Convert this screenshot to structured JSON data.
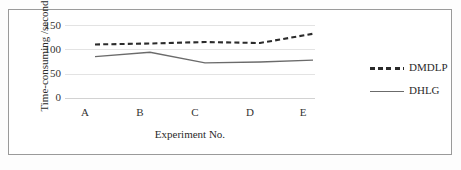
{
  "chart_data": {
    "type": "line",
    "title": "",
    "xlabel": "Experiment No.",
    "ylabel": "Time-consuming /second",
    "categories": [
      "A",
      "B",
      "C",
      "D",
      "E"
    ],
    "yticks": [
      0,
      50,
      100,
      150
    ],
    "ylim": [
      0,
      150
    ],
    "grid": true,
    "legend_position": "right",
    "series": [
      {
        "name": "DMDLP",
        "style": "dashed",
        "color": "#2b2b2b",
        "values": [
          110,
          112,
          115,
          113,
          132
        ]
      },
      {
        "name": "DHLG",
        "style": "solid",
        "color": "#6b6b6b",
        "values": [
          85,
          94,
          72,
          74,
          78
        ]
      }
    ]
  },
  "axes": {
    "y_tick_labels": [
      "150",
      "100",
      "50",
      "0"
    ],
    "x_tick_labels": [
      "A",
      "B",
      "C",
      "D",
      "E"
    ],
    "y_title": "Time-consuming /second",
    "x_title": "Experiment No."
  },
  "legend": {
    "items": [
      {
        "label": "DMDLP",
        "style": "dashed",
        "color": "#2b2b2b"
      },
      {
        "label": "DHLG",
        "style": "solid",
        "color": "#6b6b6b"
      }
    ]
  },
  "colors": {
    "frame": "#9a9a9a",
    "grid": "#e3e3e3",
    "dmdlp": "#2b2b2b",
    "dhlg": "#6b6b6b",
    "text": "#2b2b2b",
    "background": "#ffffff"
  }
}
